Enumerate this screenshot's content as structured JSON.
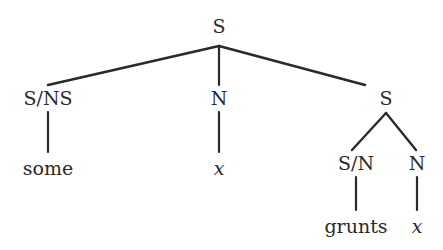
{
  "figure": {
    "type": "syntax-tree",
    "line_color": "#2a2a2a",
    "background_color": "#ffffff",
    "width": 443,
    "height": 250
  },
  "nodes": {
    "root": {
      "label": "S",
      "x": 219,
      "y": 26,
      "kind": "category"
    },
    "left_cat": {
      "label": "S/NS",
      "x": 48,
      "y": 98,
      "kind": "category"
    },
    "left_leaf": {
      "label": "some",
      "x": 48,
      "y": 168,
      "kind": "word"
    },
    "mid_cat": {
      "label": "N",
      "x": 219,
      "y": 98,
      "kind": "category"
    },
    "mid_leaf": {
      "label": "x",
      "x": 219,
      "y": 168,
      "kind": "variable"
    },
    "right_cat": {
      "label": "S",
      "x": 386,
      "y": 98,
      "kind": "category"
    },
    "right_left_cat": {
      "label": "S/N",
      "x": 356,
      "y": 163,
      "kind": "category"
    },
    "right_left_leaf": {
      "label": "grunts",
      "x": 356,
      "y": 226,
      "kind": "word"
    },
    "right_right_cat": {
      "label": "N",
      "x": 417,
      "y": 163,
      "kind": "category"
    },
    "right_right_leaf": {
      "label": "x",
      "x": 417,
      "y": 226,
      "kind": "variable"
    }
  },
  "edges": [
    {
      "name": "root-to-left-cat",
      "x1": 219,
      "y1": 46,
      "x2": 48,
      "y2": 85
    },
    {
      "name": "root-to-mid-cat",
      "x1": 219,
      "y1": 46,
      "x2": 219,
      "y2": 85
    },
    {
      "name": "root-to-right-cat",
      "x1": 219,
      "y1": 46,
      "x2": 365,
      "y2": 85
    },
    {
      "name": "left-cat-to-some",
      "x1": 48,
      "y1": 112,
      "x2": 48,
      "y2": 152
    },
    {
      "name": "mid-cat-to-x",
      "x1": 219,
      "y1": 112,
      "x2": 219,
      "y2": 152
    },
    {
      "name": "right-cat-to-s-over-n",
      "x1": 386,
      "y1": 113,
      "x2": 352,
      "y2": 150
    },
    {
      "name": "right-cat-to-n",
      "x1": 386,
      "y1": 113,
      "x2": 416,
      "y2": 150
    },
    {
      "name": "s-over-n-to-grunts",
      "x1": 356,
      "y1": 177,
      "x2": 356,
      "y2": 210
    },
    {
      "name": "n-to-x",
      "x1": 417,
      "y1": 177,
      "x2": 417,
      "y2": 210
    }
  ]
}
